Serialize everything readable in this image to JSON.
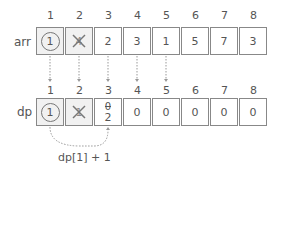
{
  "diagram": {
    "indices": [
      "1",
      "2",
      "3",
      "4",
      "5",
      "6",
      "7",
      "8"
    ],
    "arr": {
      "label": "arr",
      "cells": [
        {
          "value": "1",
          "style": "circled",
          "shaded": true
        },
        {
          "value": "4",
          "style": "crossed",
          "shaded": true
        },
        {
          "value": "2",
          "style": "plain",
          "shaded": false
        },
        {
          "value": "3",
          "style": "plain",
          "shaded": false
        },
        {
          "value": "1",
          "style": "plain",
          "shaded": false
        },
        {
          "value": "5",
          "style": "plain",
          "shaded": false
        },
        {
          "value": "7",
          "style": "plain",
          "shaded": false
        },
        {
          "value": "3",
          "style": "plain",
          "shaded": false
        }
      ]
    },
    "dp": {
      "label": "dp",
      "cells": [
        {
          "value": "1",
          "style": "circled",
          "shaded": true
        },
        {
          "value": "1",
          "style": "crossed",
          "shaded": true
        },
        {
          "value": "0",
          "new_value": "2",
          "style": "struck-update",
          "shaded": false
        },
        {
          "value": "0",
          "style": "plain",
          "shaded": false
        },
        {
          "value": "0",
          "style": "plain",
          "shaded": false
        },
        {
          "value": "0",
          "style": "plain",
          "shaded": false
        },
        {
          "value": "0",
          "style": "plain",
          "shaded": false
        },
        {
          "value": "0",
          "style": "plain",
          "shaded": false
        }
      ]
    },
    "annotation": "dp[1] + 1",
    "colors": {
      "line": "#888888",
      "text": "#555555",
      "shade": "#f1f1f1",
      "dotted": "#999999"
    }
  }
}
